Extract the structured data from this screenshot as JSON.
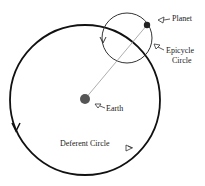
{
  "diagram": {
    "labels": {
      "planet": "Planet",
      "epicycle_line1": "Epicycle",
      "epicycle_line2": "Circle",
      "earth": "Earth",
      "deferent": "Deferent Circle"
    },
    "colors": {
      "stroke": "#111111",
      "earth": "#555555",
      "planet": "#222222",
      "line": "#999999"
    }
  }
}
